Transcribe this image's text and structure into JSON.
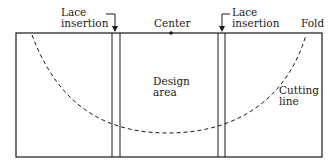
{
  "labels": {
    "lace_left": [
      "Lace",
      "insertion"
    ],
    "center": "Center",
    "lace_right": [
      "Lace",
      "insertion"
    ],
    "fold": "Fold",
    "design_area": [
      "Design",
      "area"
    ],
    "cutting_line": [
      "Cutting",
      "line"
    ]
  },
  "colors": {
    "line": "#1a1a1a",
    "background": "#ffffff"
  }
}
